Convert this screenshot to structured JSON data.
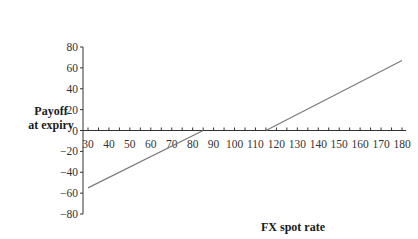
{
  "chart_data": {
    "type": "line",
    "title": "",
    "xlabel": "FX spot rate",
    "ylabel_line1": "Payoff",
    "ylabel_line2": "at expiry",
    "xlim": [
      30,
      180
    ],
    "ylim": [
      -80,
      80
    ],
    "xticks": [
      30,
      40,
      50,
      60,
      70,
      80,
      90,
      100,
      110,
      120,
      130,
      140,
      150,
      160,
      170,
      180
    ],
    "yticks": [
      80,
      60,
      40,
      20,
      0,
      -20,
      -40,
      -60,
      -80
    ],
    "grid": false,
    "legend": null,
    "series": [
      {
        "name": "Short put payoff (strike ~85)",
        "x": [
          30,
          85
        ],
        "y": [
          -55,
          0
        ]
      },
      {
        "name": "Zero payoff region",
        "x": [
          85,
          115
        ],
        "y": [
          0,
          0
        ]
      },
      {
        "name": "Long call payoff (strike ~115)",
        "x": [
          115,
          180
        ],
        "y": [
          0,
          67
        ]
      }
    ],
    "line_color": "#7a7a7a"
  }
}
